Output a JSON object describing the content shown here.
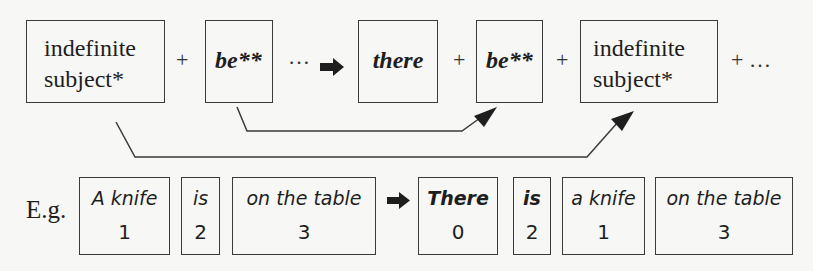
{
  "diagram": {
    "top_row": {
      "boxes": [
        {
          "line1": "indefinite",
          "line2": "subject*"
        },
        {
          "label": "be**"
        },
        {
          "label": "there"
        },
        {
          "label": "be**"
        },
        {
          "line1": "indefinite",
          "line2": "subject*"
        }
      ],
      "operators": {
        "plus": "+",
        "ellipsis": "…",
        "tail": "+ …"
      }
    },
    "arrows": [
      {
        "from": "be** (left)",
        "to": "be** (right)"
      },
      {
        "from": "indefinite subject* (left)",
        "to": "indefinite subject* (right)"
      }
    ],
    "example": {
      "prefix": "E.g.",
      "before": [
        {
          "word": "A knife",
          "num": "1"
        },
        {
          "word": "is",
          "num": "2"
        },
        {
          "word": "on the table",
          "num": "3"
        }
      ],
      "after": [
        {
          "word": "There",
          "num": "0"
        },
        {
          "word": "is",
          "num": "2"
        },
        {
          "word": "a knife",
          "num": "1"
        },
        {
          "word": "on the table",
          "num": "3"
        }
      ]
    },
    "colors": {
      "line": "#3a3a3a",
      "text": "#1e1e1e",
      "background": "#f7f7f5"
    }
  }
}
